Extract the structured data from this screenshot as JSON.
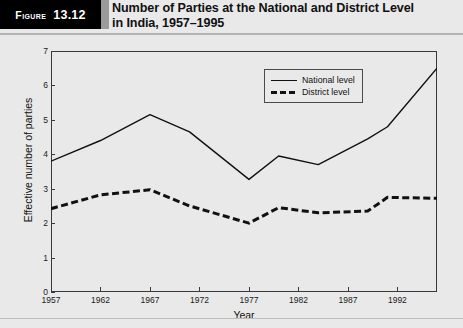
{
  "header": {
    "figure_word": "Figure",
    "figure_number": "13.12",
    "title_line1": "Number of Parties at the National and District Level",
    "title_line2": "in India, 1957–1995"
  },
  "legend": {
    "national_label": "National level",
    "district_label": "District level"
  },
  "chart_data": {
    "type": "line",
    "title": "Number of Parties at the National and District Level in India, 1957–1995",
    "xlabel": "Year",
    "ylabel": "Effective number of parties",
    "xlim": [
      1957,
      1996
    ],
    "ylim": [
      0,
      7
    ],
    "yticks": [
      0,
      1,
      2,
      3,
      4,
      5,
      6,
      7
    ],
    "xticks": [
      1957,
      1962,
      1967,
      1972,
      1977,
      1982,
      1987,
      1992
    ],
    "grid": false,
    "legend_position": "top-right",
    "series": [
      {
        "name": "National level",
        "style": "solid",
        "color": "#111111",
        "x": [
          1957,
          1962,
          1967,
          1971,
          1977,
          1980,
          1984,
          1989,
          1991,
          1996
        ],
        "values": [
          3.8,
          4.4,
          5.15,
          4.65,
          3.27,
          3.95,
          3.7,
          4.45,
          4.8,
          6.5
        ]
      },
      {
        "name": "District level",
        "style": "dashed",
        "color": "#111111",
        "x": [
          1957,
          1962,
          1967,
          1971,
          1977,
          1980,
          1984,
          1989,
          1991,
          1996
        ],
        "values": [
          2.42,
          2.82,
          2.97,
          2.5,
          2.0,
          2.45,
          2.3,
          2.35,
          2.75,
          2.72
        ]
      }
    ]
  }
}
